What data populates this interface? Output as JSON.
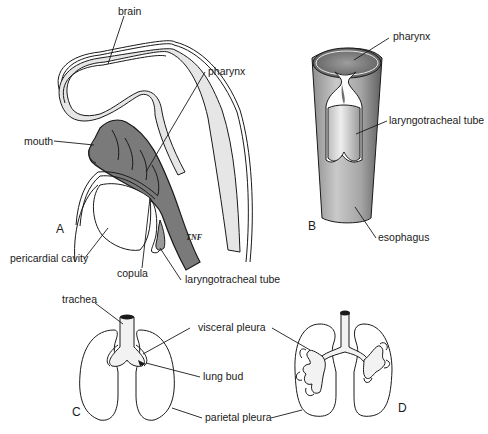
{
  "figure": {
    "panels": [
      {
        "id": "A",
        "letter": "A",
        "description": "Sagittal section of embryo head showing brain, pharynx and laryngotracheal tube",
        "labels": {
          "brain": "brain",
          "pharynx": "pharynx",
          "mouth": "mouth",
          "pericardial_cavity": "pericardial cavity",
          "copula": "copula",
          "laryngotracheal_tube": "laryngotracheal tube"
        },
        "signature": "TNF"
      },
      {
        "id": "B",
        "letter": "B",
        "description": "Foregut tube with laryngotracheal diverticulum",
        "labels": {
          "pharynx": "pharynx",
          "laryngotracheal_tube": "laryngotracheal tube",
          "esophagus": "esophagus"
        }
      },
      {
        "id": "C",
        "letter": "C",
        "description": "Early lung bud invaginating into pleural cavities",
        "labels": {
          "trachea": "trachea",
          "visceral_pleura": "visceral pleura",
          "lung_bud": "lung bud",
          "parietal_pleura": "parietal pleura"
        }
      },
      {
        "id": "D",
        "letter": "D",
        "description": "Branching bronchial tree within pleural cavities"
      }
    ],
    "colors": {
      "line": "#1a1a1a",
      "brain_fill": "#e6e6e6",
      "pharynx_fill": "#7a7a7a",
      "tube_fill": "#a8a8a8",
      "tube_light": "#d9d9d9",
      "background": "#ffffff"
    }
  }
}
